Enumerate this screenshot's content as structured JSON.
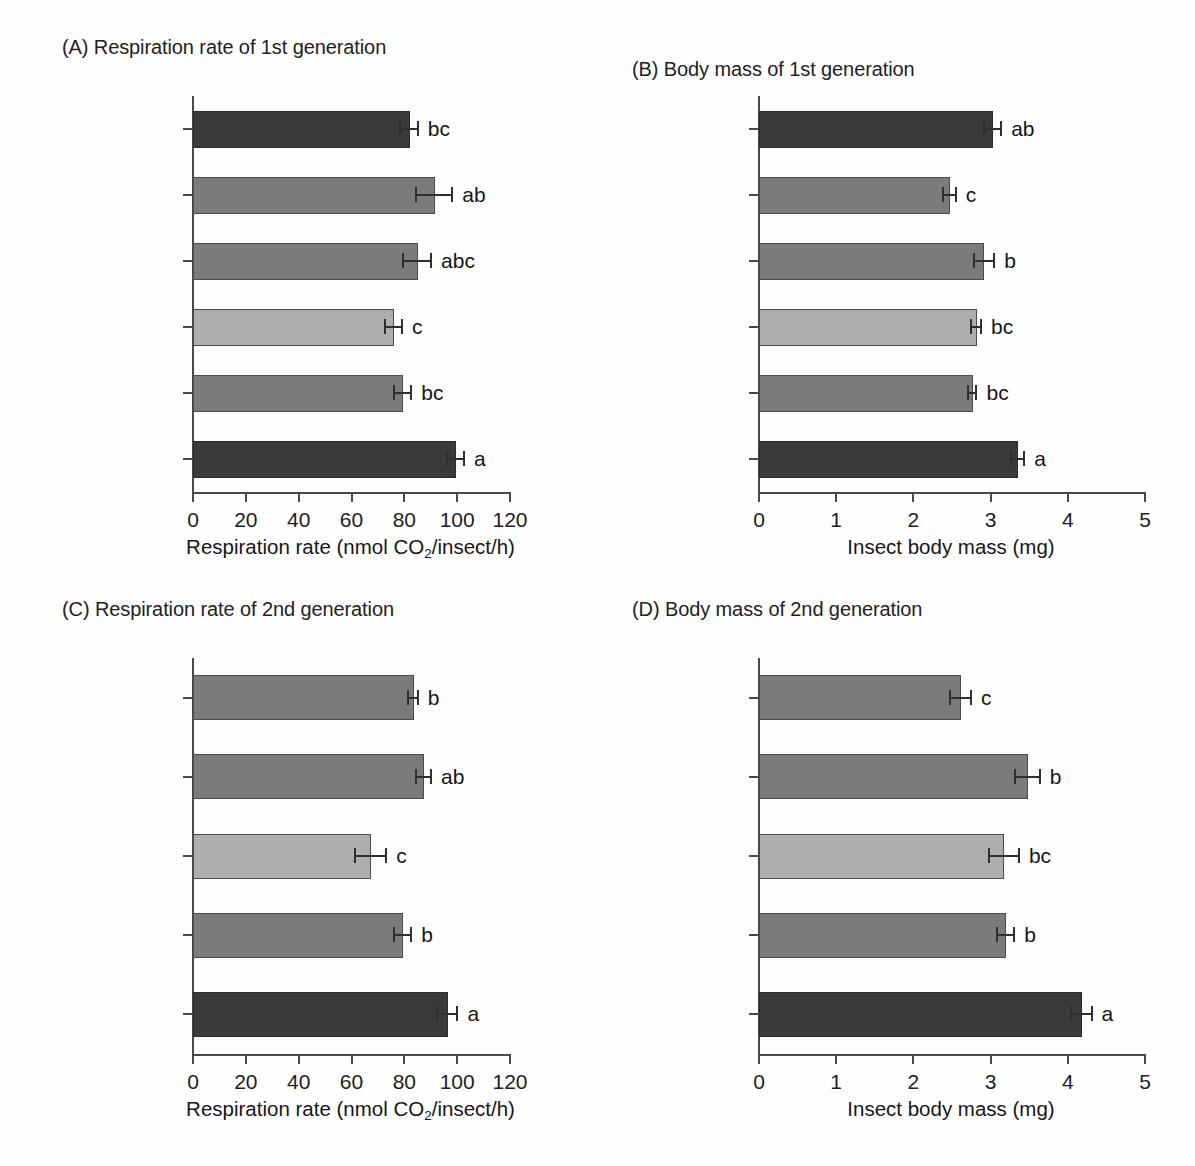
{
  "figure": {
    "background": "#ffffff"
  },
  "colors": {
    "dark": "#3b3b3b",
    "mid": "#7b7b7b",
    "light": "#aeaeae",
    "axis": "#4a4a4a",
    "label": "#5e5e5e",
    "label_bold": "#343434"
  },
  "axis_titles": {
    "respiration_prefix": "Respiration rate (nmol CO",
    "respiration_sub": "2",
    "respiration_suffix": "/insect/h)",
    "body_mass": "Insect body mass (mg)"
  },
  "chart_data": [
    {
      "id": "panel-a",
      "type": "bar",
      "orientation": "horizontal",
      "title": "(A) Respiration rate of 1st generation",
      "panel_letter": "(A)",
      "xlabel": "Respiration rate (nmol CO2/insect/h)",
      "ylabel": "",
      "xlim": [
        0,
        120
      ],
      "xticks": [
        0,
        20,
        40,
        60,
        80,
        100,
        120
      ],
      "xticklabels": [
        "0",
        "20",
        "40",
        "60",
        "80",
        "100",
        "120"
      ],
      "grid": false,
      "legend": "none",
      "categories": [
        "Thermal treatment",
        "Tetracycline",
        "Rifamycin",
        "Ciprofloxacin",
        "Amoxicillin",
        "Untreated control"
      ],
      "values": [
        82.0,
        91.5,
        85.0,
        76.0,
        79.5,
        99.5
      ],
      "errors": [
        3.5,
        7.0,
        5.5,
        3.5,
        3.5,
        3.5
      ],
      "sig_letters": [
        "bc",
        "ab",
        "abc",
        "c",
        "bc",
        "a"
      ],
      "shades": [
        "dark",
        "mid",
        "mid",
        "light",
        "mid",
        "dark"
      ],
      "bold_labels": [
        true,
        false,
        false,
        false,
        false,
        true
      ]
    },
    {
      "id": "panel-b",
      "type": "bar",
      "orientation": "horizontal",
      "title": "(B) Body mass of 1st generation",
      "panel_letter": "(B)",
      "xlabel": "Insect body mass (mg)",
      "ylabel": "",
      "xlim": [
        0,
        5
      ],
      "xticks": [
        0,
        1,
        2,
        3,
        4,
        5
      ],
      "xticklabels": [
        "0",
        "1",
        "2",
        "3",
        "4",
        "5"
      ],
      "grid": false,
      "legend": "none",
      "categories": [
        "Thermal treatment",
        "Tetracycline",
        "Rifamycin",
        "Ciprofloxacin",
        "Amoxicillin",
        "Untreated control"
      ],
      "values": [
        3.03,
        2.47,
        2.92,
        2.82,
        2.77,
        3.36
      ],
      "errors": [
        0.12,
        0.09,
        0.14,
        0.07,
        0.06,
        0.09
      ],
      "sig_letters": [
        "ab",
        "c",
        "b",
        "bc",
        "bc",
        "a"
      ],
      "shades": [
        "dark",
        "mid",
        "mid",
        "light",
        "mid",
        "dark"
      ],
      "bold_labels": [
        true,
        false,
        false,
        false,
        false,
        true
      ]
    },
    {
      "id": "panel-c",
      "type": "bar",
      "orientation": "horizontal",
      "title": "(C) Respiration rate of 2nd generation",
      "panel_letter": "(C)",
      "xlabel": "Respiration rate (nmol CO2/insect/h)",
      "ylabel": "",
      "xlim": [
        0,
        120
      ],
      "xticks": [
        0,
        20,
        40,
        60,
        80,
        100,
        120
      ],
      "xticklabels": [
        "0",
        "20",
        "40",
        "60",
        "80",
        "100",
        "120"
      ],
      "grid": false,
      "legend": "none",
      "categories": [
        "Tetracycline",
        "Rifamycin",
        "Ciprofloxacin",
        "Amoxicillin",
        "Untreated control"
      ],
      "values": [
        83.5,
        87.5,
        67.5,
        79.5,
        96.5
      ],
      "errors": [
        2.0,
        3.0,
        6.0,
        3.5,
        4.0
      ],
      "sig_letters": [
        "b",
        "ab",
        "c",
        "b",
        "a"
      ],
      "shades": [
        "mid",
        "mid",
        "light",
        "mid",
        "dark"
      ],
      "bold_labels": [
        false,
        false,
        false,
        false,
        true
      ]
    },
    {
      "id": "panel-d",
      "type": "bar",
      "orientation": "horizontal",
      "title": "(D) Body mass of 2nd generation",
      "panel_letter": "(D)",
      "xlabel": "Insect body mass (mg)",
      "ylabel": "",
      "xlim": [
        0,
        5
      ],
      "xticks": [
        0,
        1,
        2,
        3,
        4,
        5
      ],
      "xticklabels": [
        "0",
        "1",
        "2",
        "3",
        "4",
        "5"
      ],
      "grid": false,
      "legend": "none",
      "categories": [
        "Tetracycline",
        "Rifamycin",
        "Ciprofloxacin",
        "Amoxicillin",
        "Untreated control"
      ],
      "values": [
        2.62,
        3.48,
        3.18,
        3.2,
        4.18
      ],
      "errors": [
        0.14,
        0.17,
        0.2,
        0.12,
        0.14
      ],
      "sig_letters": [
        "c",
        "b",
        "bc",
        "b",
        "a"
      ],
      "shades": [
        "mid",
        "mid",
        "light",
        "mid",
        "dark"
      ],
      "bold_labels": [
        false,
        false,
        false,
        false,
        true
      ]
    }
  ]
}
